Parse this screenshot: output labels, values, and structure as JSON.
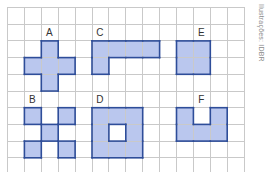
{
  "figure": {
    "credit": "Ilustrações: IDBR",
    "grid": {
      "columns": 14,
      "rows": 10,
      "cell_w": 16.9,
      "cell_h": 16.7,
      "origin_x": 7,
      "origin_y": 7
    },
    "colors": {
      "fill": "#bac7ee",
      "border": "#2e4d99",
      "grid_line": "#c9c9c9",
      "label": "#333333"
    },
    "shapes": [
      {
        "id": "A",
        "label": "A",
        "label_cell": [
          2,
          1
        ],
        "cells": [
          [
            2,
            2
          ],
          [
            1,
            3
          ],
          [
            2,
            3
          ],
          [
            3,
            3
          ],
          [
            2,
            4
          ]
        ]
      },
      {
        "id": "C",
        "label": "C",
        "label_cell": [
          5,
          1
        ],
        "cells": [
          [
            5,
            2
          ],
          [
            6,
            2
          ],
          [
            7,
            2
          ],
          [
            8,
            2
          ],
          [
            5,
            3
          ]
        ]
      },
      {
        "id": "E",
        "label": "E",
        "label_cell": [
          11,
          1
        ],
        "cells": [
          [
            10,
            2
          ],
          [
            11,
            2
          ],
          [
            10,
            3
          ],
          [
            11,
            3
          ]
        ]
      },
      {
        "id": "B",
        "label": "B",
        "label_cell": [
          1,
          5
        ],
        "cells": [
          [
            1,
            6
          ],
          [
            3,
            6
          ],
          [
            2,
            7
          ],
          [
            1,
            8
          ],
          [
            3,
            8
          ]
        ]
      },
      {
        "id": "D",
        "label": "D",
        "label_cell": [
          5,
          5
        ],
        "cells": [
          [
            5,
            6
          ],
          [
            6,
            6
          ],
          [
            7,
            6
          ],
          [
            5,
            7
          ],
          [
            7,
            7
          ],
          [
            5,
            8
          ],
          [
            6,
            8
          ],
          [
            7,
            8
          ]
        ]
      },
      {
        "id": "F",
        "label": "F",
        "label_cell": [
          11,
          5
        ],
        "cells": [
          [
            10,
            6
          ],
          [
            12,
            6
          ],
          [
            10,
            7
          ],
          [
            11,
            7
          ],
          [
            12,
            7
          ]
        ]
      }
    ]
  }
}
